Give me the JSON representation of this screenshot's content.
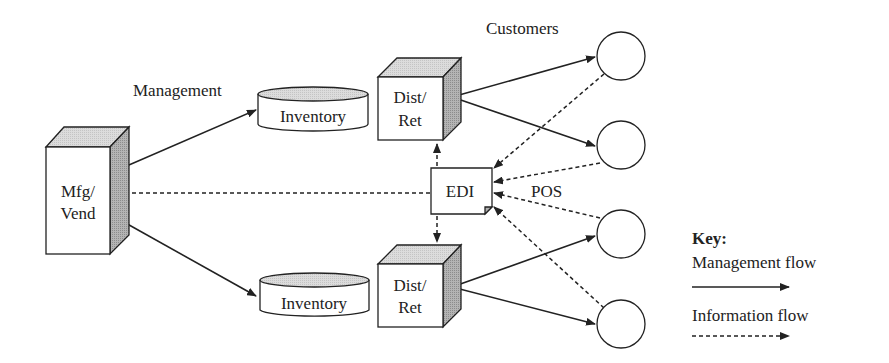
{
  "labels": {
    "management": "Management",
    "customers": "Customers",
    "pos": "POS"
  },
  "nodes": {
    "mfg_vend": {
      "line1": "Mfg/",
      "line2": "Vend"
    },
    "inventory_top": {
      "label": "Inventory"
    },
    "inventory_bottom": {
      "label": "Inventory"
    },
    "dist_ret_top": {
      "line1": "Dist/",
      "line2": "Ret"
    },
    "dist_ret_bottom": {
      "line1": "Dist/",
      "line2": "Ret"
    },
    "edi": {
      "label": "EDI"
    },
    "customers": [
      {
        "id": "customer-1"
      },
      {
        "id": "customer-2"
      },
      {
        "id": "customer-3"
      },
      {
        "id": "customer-4"
      }
    ]
  },
  "key": {
    "title": "Key:",
    "management_flow": "Management flow",
    "information_flow": "Information flow"
  },
  "colors": {
    "stroke": "#222222",
    "top_face": "#d4d4d4",
    "side_face": "#a8a8a8",
    "fold": "#b0b0b0"
  }
}
